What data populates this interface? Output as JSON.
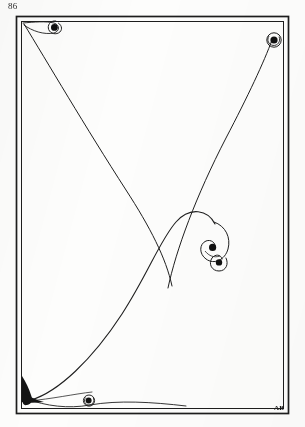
{
  "page": {
    "folio_number": "86",
    "monogram": "AB",
    "background_color": "#fdfdfc",
    "ink_color": "#1a1a1a",
    "width": 305,
    "height": 427
  },
  "frame": {
    "style": "double-rule rectangle",
    "outer": {
      "x": 16,
      "y": 16,
      "width": 273,
      "height": 398
    },
    "inner": {
      "x": 21,
      "y": 21,
      "width": 263,
      "height": 388
    },
    "outer_stroke_width": 1.6,
    "inner_stroke_width": 1.0,
    "stroke_color": "#1d1d1d"
  },
  "ornaments": [
    {
      "name": "top-left-spiral",
      "description": "small spiral with solid dot, linked to corner by a looping stem",
      "center_x": 54,
      "center_y": 27,
      "dot_radius": 3.4,
      "ring_radius": 6.2
    },
    {
      "name": "top-right-spiral",
      "description": "spiral with solid dot inside an open ring, terminus of the right sweeping curve",
      "center_x": 274,
      "center_y": 40,
      "dot_radius": 3.6,
      "ring_radius": 7.4
    },
    {
      "name": "center-spiral-upper",
      "description": "spiral terminal with solid dot on the inner scroll",
      "center_x": 213,
      "center_y": 247,
      "dot_radius": 3.6,
      "ring_radius": 7.0
    },
    {
      "name": "center-spiral-lower",
      "description": "second, smaller spiral with solid dot below the first",
      "center_x": 219,
      "center_y": 262,
      "dot_radius": 3.2,
      "ring_radius": 6.2
    },
    {
      "name": "bottom-left-ink-blob",
      "description": "heavy solid ink wedge filling the lower-left corner where the great curve lands",
      "center_x": 27,
      "center_y": 398
    },
    {
      "name": "bottom-left-small-spiral",
      "description": "small spiral with solid dot resting on the lower rule",
      "center_x": 89,
      "center_y": 401,
      "dot_radius": 3.0,
      "ring_radius": 5.6
    }
  ],
  "curves": [
    {
      "name": "left-descending-sweep",
      "description": "long concave curve falling from the top-left corner down to the valley at center-bottom"
    },
    {
      "name": "right-ascending-sweep",
      "description": "long curve rising from the valley up to the top-right spiral"
    },
    {
      "name": "great-diagonal-sweep",
      "description": "principal S-curve running from the bottom-left ink blob up to the central spirals"
    },
    {
      "name": "baseline-tendril",
      "description": "thin tendril skimming along the bottom rule from the ink blob past the small spiral"
    },
    {
      "name": "top-left-stem",
      "description": "short looping stem joining the top-left corner to its spiral"
    }
  ]
}
